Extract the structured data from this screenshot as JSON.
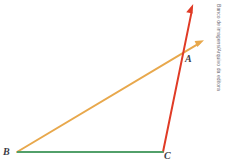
{
  "figure": {
    "background_color": "#ffffff",
    "width": 226,
    "height": 165,
    "credit": "Banco de imagens/Arquivo da editora",
    "labels": {
      "a": "A",
      "b": "B",
      "c": "C"
    },
    "colors": {
      "base_segment": "#52a06a",
      "orange_ray": "#e8a84c",
      "red_ray": "#e03b26",
      "label": "#3c3c46",
      "credit": "#6e6e78"
    },
    "points": {
      "A": {
        "x": 181,
        "y": 56
      },
      "B": {
        "x": 17,
        "y": 152
      },
      "C": {
        "x": 163,
        "y": 152
      }
    },
    "elements": [
      {
        "name": "segment-BC",
        "kind": "segment",
        "color": "#52a06a",
        "from": {
          "x": 17,
          "y": 152
        },
        "to": {
          "x": 163,
          "y": 152
        },
        "arrow": false,
        "width": 2
      },
      {
        "name": "ray-BA",
        "kind": "ray",
        "color": "#e8a84c",
        "from": {
          "x": 17,
          "y": 152
        },
        "to": {
          "x": 203,
          "y": 41
        },
        "arrow": true,
        "width": 2
      },
      {
        "name": "ray-CA",
        "kind": "ray",
        "color": "#e03b26",
        "from": {
          "x": 163,
          "y": 152
        },
        "to": {
          "x": 193,
          "y": 5
        },
        "arrow": true,
        "width": 2
      }
    ]
  }
}
